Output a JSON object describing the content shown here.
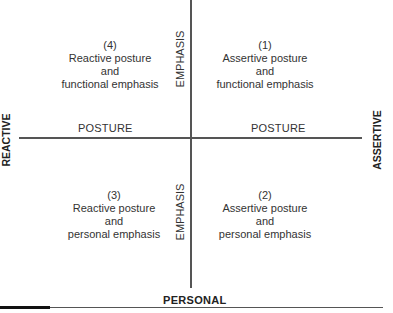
{
  "diagram": {
    "axes": {
      "left_label": "REACTIVE",
      "right_label": "ASSERTIVE",
      "bottom_label": "PERSONAL",
      "horizontal_axis_label_left": "POSTURE",
      "horizontal_axis_label_right": "POSTURE",
      "vertical_axis_label_top": "EMPHASIS",
      "vertical_axis_label_bottom": "EMPHASIS"
    },
    "quadrants": [
      {
        "number": "(1)",
        "line1": "Assertive posture",
        "line2": "and",
        "line3": "functional emphasis",
        "position": "top-right"
      },
      {
        "number": "(2)",
        "line1": "Assertive posture",
        "line2": "and",
        "line3": "personal emphasis",
        "position": "bottom-right"
      },
      {
        "number": "(3)",
        "line1": "Reactive posture",
        "line2": "and",
        "line3": "personal emphasis",
        "position": "bottom-left"
      },
      {
        "number": "(4)",
        "line1": "Reactive posture",
        "line2": "and",
        "line3": "functional emphasis",
        "position": "top-left"
      }
    ],
    "colors": {
      "line": "#555555",
      "text": "#333333",
      "bar": "#111111"
    }
  }
}
